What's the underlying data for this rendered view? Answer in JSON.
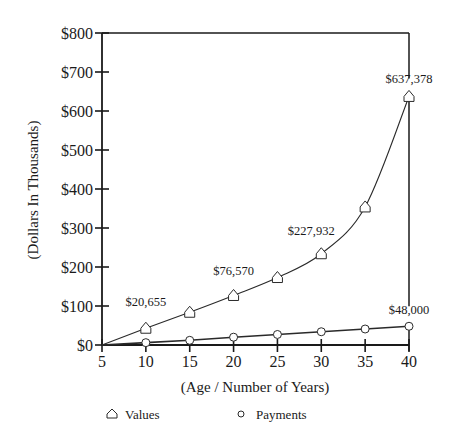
{
  "chart_data": {
    "type": "line",
    "title": "",
    "xlabel": "(Age / Number of Years)",
    "ylabel": "(Dollars In Thousands)",
    "x": [
      10,
      15,
      20,
      25,
      30,
      35,
      40
    ],
    "x_ticks": [
      5,
      10,
      15,
      20,
      25,
      30,
      35,
      40
    ],
    "xlim": [
      5,
      40
    ],
    "y_ticks": [
      0,
      100,
      200,
      300,
      400,
      500,
      600,
      700,
      800
    ],
    "y_tick_labels": [
      "$0",
      "$100",
      "$200",
      "$300",
      "$400",
      "$500",
      "$600",
      "$700",
      "$800"
    ],
    "ylim": [
      0,
      800
    ],
    "grid": false,
    "legend_position": "bottom",
    "series": [
      {
        "name": "Values",
        "marker": "house-triangle",
        "values": [
          43,
          84,
          127,
          173,
          234,
          354,
          637.378
        ]
      },
      {
        "name": "Payments",
        "marker": "circle",
        "values": [
          6,
          12,
          20,
          27,
          34,
          41,
          48
        ]
      }
    ],
    "annotations": [
      {
        "series": "Values",
        "x": 10,
        "text": "$20,655"
      },
      {
        "series": "Values",
        "x": 20,
        "text": "$76,570"
      },
      {
        "series": "Values",
        "x": 30,
        "text": "$227,932"
      },
      {
        "series": "Values",
        "x": 40,
        "text": "$637,378"
      },
      {
        "series": "Payments",
        "x": 40,
        "text": "$48,000"
      }
    ]
  },
  "legend": {
    "values_label": "Values",
    "payments_label": "Payments"
  },
  "colors": {
    "axis": "#1a1a1a",
    "line": "#2a2a2a",
    "marker_fill": "#ffffff"
  }
}
